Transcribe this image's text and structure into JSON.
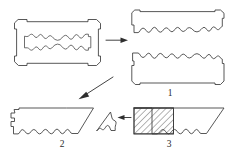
{
  "figure": {
    "background_color": "#ffffff",
    "stroke_color": "#3a3a3a",
    "hatch_color": "#3a3a3a",
    "width": 232,
    "height": 159,
    "labels": [
      {
        "id": "label-1",
        "text": "1",
        "x": 170,
        "y": 96
      },
      {
        "id": "label-2",
        "text": "2",
        "x": 62,
        "y": 147
      },
      {
        "id": "label-3",
        "text": "3",
        "x": 169,
        "y": 147
      }
    ],
    "parts": [
      {
        "id": "whole-blade",
        "name": "whole-razor-blade",
        "label": "",
        "description": "Complete double-edge razor blade with notched corners and central wavy slot"
      },
      {
        "id": "blade-half-top",
        "name": "blade-half-upper",
        "label": "",
        "description": "Upper half of blade: straight top edge, wavy fracture edge at bottom"
      },
      {
        "id": "blade-half-bottom",
        "name": "blade-half-lower",
        "label": "1",
        "description": "Lower half of blade: wavy fracture edge at top, straight bottom edge"
      },
      {
        "id": "blade-piece-2",
        "name": "blade-piece-two",
        "label": "2",
        "description": "Left fragment with wavy lower edge and slanted right cut"
      },
      {
        "id": "blade-piece-3",
        "name": "blade-piece-three",
        "label": "3",
        "description": "Right fragment with hatched cross-section block at left end"
      },
      {
        "id": "blade-chip",
        "name": "blade-chip-fragment",
        "label": "",
        "description": "Small detached triangular chip"
      }
    ],
    "arrows": [
      {
        "id": "arrow-blade-to-halves",
        "name": "arrow-horizontal",
        "direction": "right",
        "from": "whole-blade",
        "to": "blade-half-top"
      },
      {
        "id": "arrow-blade-to-pieces",
        "name": "arrow-diagonal",
        "direction": "down-left",
        "from": "whole-blade",
        "to": "blade-piece-2"
      },
      {
        "id": "arrow-chip",
        "name": "arrow-chip-detach",
        "direction": "left",
        "from": "blade-piece-3",
        "to": "blade-chip"
      }
    ],
    "hatch": {
      "id": "section-hatch",
      "name": "cross-section-hatching",
      "angle_deg": 45,
      "spacing_px": 3.1,
      "region": "left end of piece 3"
    }
  }
}
